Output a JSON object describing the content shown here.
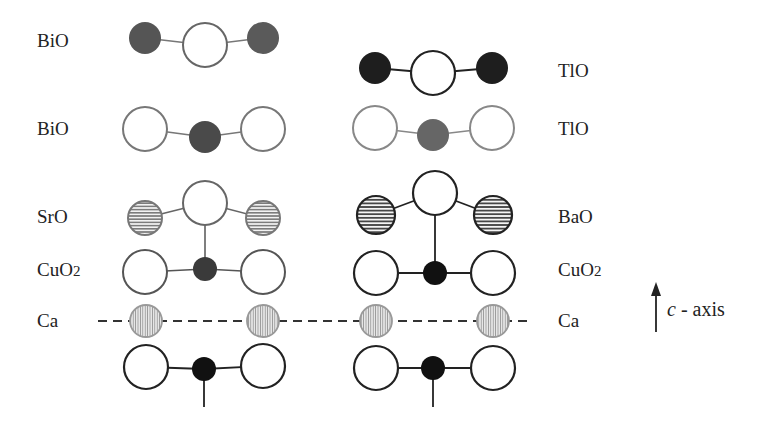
{
  "colors": {
    "dark_atom": "#2a2a2a",
    "gray_atom": "#5e5e5e",
    "hatched_atom_fill": "#e8e8e8",
    "ca_atom_fill": "#d9d9d9",
    "bond": "#222222",
    "light_bond": "#8a8a8a"
  },
  "left_labels": [
    {
      "text": "BiO",
      "y": 47
    },
    {
      "text": "BiO",
      "y": 135
    },
    {
      "text": "SrO",
      "y": 223
    },
    {
      "text": "CuO",
      "sub": "2",
      "y": 276
    },
    {
      "text": "Ca",
      "y": 327
    }
  ],
  "right_labels": [
    {
      "text": "TlO",
      "y": 77
    },
    {
      "text": "TlO",
      "y": 135
    },
    {
      "text": "BaO",
      "y": 223
    },
    {
      "text": "CuO",
      "sub": "2",
      "y": 276
    },
    {
      "text": "Ca",
      "y": 327
    }
  ],
  "axis": {
    "symbol": "c",
    "label": " - axis"
  },
  "layers": {
    "left": [
      "BiO",
      "BiO",
      "SrO",
      "CuO2",
      "Ca",
      "CuO2"
    ],
    "right": [
      "TlO",
      "TlO",
      "BaO",
      "CuO2",
      "Ca",
      "CuO2"
    ]
  }
}
